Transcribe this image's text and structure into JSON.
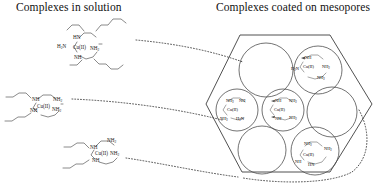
{
  "figure": {
    "width": 385,
    "height": 188,
    "background": "#ffffff",
    "ink_color": "#1a1a1a"
  },
  "titles": {
    "left": "Complexes in solution",
    "right": "Complexes coated on mesopores"
  },
  "chemistry": {
    "metal_center": "Cu(II)",
    "ligand_labels": {
      "amine_primary": "NH2",
      "amine_primary_reversed": "H2N",
      "amine_secondary": "NH",
      "amine_secondary_reversed": "HN"
    }
  },
  "solution_complexes": [
    {
      "id": "complex-top",
      "center_label": "Cu(II)",
      "labels": [
        "HN",
        "H2N",
        "NH2",
        "NH"
      ]
    },
    {
      "id": "complex-middle",
      "center_label": "Cu(II)",
      "labels": [
        "NH",
        "NH2",
        "NH",
        "NH2"
      ]
    },
    {
      "id": "complex-bottom",
      "center_label": "Cu(II)",
      "labels": [
        "NH",
        "NH2",
        "NH2",
        "NH"
      ]
    }
  ],
  "mesopore_structure": {
    "shape": "hexagon",
    "pore_count": 7,
    "pores": [
      {
        "id": "pore-top-left",
        "occupied": false,
        "complex": null
      },
      {
        "id": "pore-top-right",
        "occupied": true,
        "complex": {
          "center_label": "Cu(II)",
          "labels": [
            "NH",
            "H2N",
            "NH2",
            "NH2"
          ]
        }
      },
      {
        "id": "pore-mid-left",
        "occupied": true,
        "complex": {
          "center_label": "Cu(II)",
          "labels": [
            "NH2",
            "NH",
            "NH2",
            "H2N"
          ]
        }
      },
      {
        "id": "pore-mid-center",
        "occupied": true,
        "complex": {
          "center_label": "Cu(II)",
          "labels": [
            "NH",
            "NH2",
            "NH",
            "NH2"
          ]
        }
      },
      {
        "id": "pore-mid-right",
        "occupied": false,
        "complex": null
      },
      {
        "id": "pore-bottom-left",
        "occupied": false,
        "complex": null
      },
      {
        "id": "pore-bottom-right",
        "occupied": true,
        "complex": {
          "center_label": "Cu(II)",
          "labels": [
            "NH2",
            "NH2",
            "NH",
            "HN"
          ]
        }
      }
    ]
  },
  "connectors": [
    {
      "id": "connector-top",
      "style": "dotted",
      "from": "complex-top",
      "to": "hexagon-upper-left"
    },
    {
      "id": "connector-middle",
      "style": "dotted",
      "from": "complex-middle",
      "to": "hexagon-left"
    },
    {
      "id": "connector-bottom",
      "style": "dotted",
      "from": "complex-bottom",
      "to": "hexagon-lower-left"
    },
    {
      "id": "connector-outline",
      "style": "dotted",
      "from": "hexagon-bottom",
      "to": "hexagon-right"
    }
  ]
}
